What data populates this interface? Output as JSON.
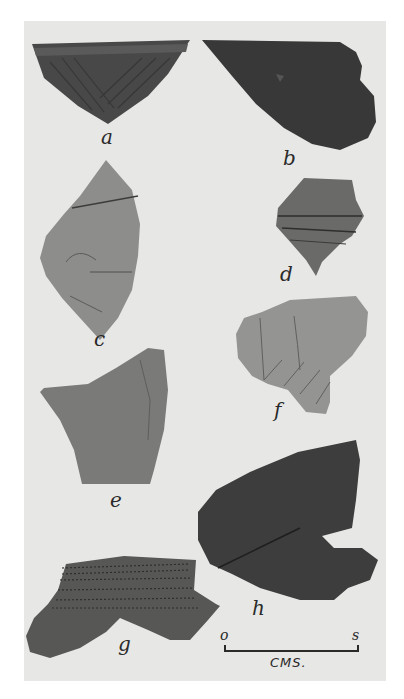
{
  "figure": {
    "background_color": "#e7e7e5",
    "sherds": [
      {
        "label": "a",
        "tone": "#4a4a4a",
        "decoration": "incised diagonal lines"
      },
      {
        "label": "b",
        "tone": "#3a3a3a",
        "decoration": "plain"
      },
      {
        "label": "c",
        "tone": "#8a8a88",
        "decoration": "incised lines"
      },
      {
        "label": "d",
        "tone": "#6a6a68",
        "decoration": "horizontal incised bands"
      },
      {
        "label": "e",
        "tone": "#7a7a78",
        "decoration": "plain"
      },
      {
        "label": "f",
        "tone": "#939391",
        "decoration": "incised curved lines"
      },
      {
        "label": "g",
        "tone": "#5a5a58",
        "decoration": "punctate rows"
      },
      {
        "label": "h",
        "tone": "#3e3e3e",
        "decoration": "plain with crack"
      }
    ],
    "scale": {
      "start": "o",
      "end": "s",
      "unit": "CMS."
    }
  }
}
